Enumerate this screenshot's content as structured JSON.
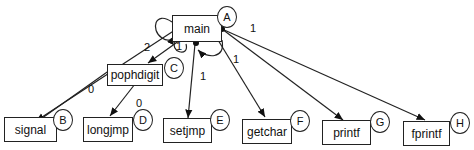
{
  "diagram": {
    "type": "call-graph",
    "nodes": [
      {
        "id": "main",
        "label": "main",
        "badge": "A"
      },
      {
        "id": "signal",
        "label": "signal",
        "badge": "B"
      },
      {
        "id": "pophdigit",
        "label": "pophdigit",
        "badge": "C"
      },
      {
        "id": "longjmp",
        "label": "longjmp",
        "badge": "D"
      },
      {
        "id": "setjmp",
        "label": "setjmp",
        "badge": "E"
      },
      {
        "id": "getchar",
        "label": "getchar",
        "badge": "F"
      },
      {
        "id": "printf",
        "label": "printf",
        "badge": "G"
      },
      {
        "id": "fprintf",
        "label": "fprintf",
        "badge": "H"
      }
    ],
    "edge_labels": {
      "main_loop_left": "2",
      "main_to_pophdigit": "1",
      "main_loop_right": "1",
      "main_to_fprintf": "1",
      "setjmp_return": "1",
      "pophdigit_to_signal": "0",
      "pophdigit_to_longjmp": "0"
    }
  }
}
